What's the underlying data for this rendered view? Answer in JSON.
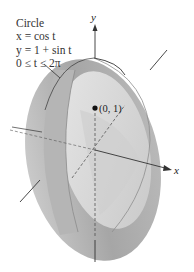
{
  "caption": {
    "title": "Circle",
    "line1": "x = cos t",
    "line2": "y = 1 + sin t",
    "line3": "0 ≤ t ≤ 2π"
  },
  "axes": {
    "y_label": "y",
    "x_label": "x"
  },
  "point": {
    "label": "(0, 1)"
  },
  "colors": {
    "surface_outer": "#a9a9a9",
    "surface_inner": "#d4d4d4",
    "surface_band": "#bcbcbc",
    "axis": "#333333"
  }
}
